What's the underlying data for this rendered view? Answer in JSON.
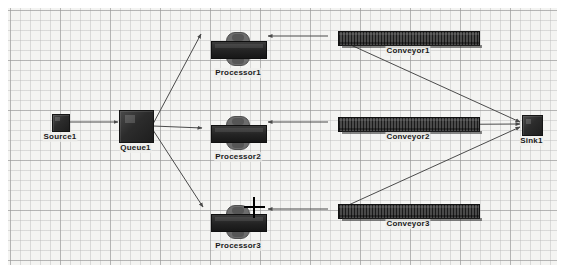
{
  "canvas": {
    "background_color": "#f4f4f2",
    "grid_minor_color": "#b9b9b9",
    "grid_major_color": "#969696",
    "grid_minor_spacing": 10,
    "grid_major_spacing": 50
  },
  "objects": [
    {
      "id": "source1",
      "label": "Source1",
      "type": "source",
      "x": 44,
      "y": 106,
      "w": 16,
      "h": 16,
      "color": "#262626"
    },
    {
      "id": "queue1",
      "label": "Queue1",
      "type": "queue",
      "x": 111,
      "y": 102,
      "w": 33,
      "h": 31,
      "color": "#262626"
    },
    {
      "id": "processor1",
      "label": "Processor1",
      "type": "processor",
      "x": 203,
      "y": 24,
      "w": 54,
      "h": 34,
      "color": "#232323"
    },
    {
      "id": "processor2",
      "label": "Processor2",
      "type": "processor",
      "x": 203,
      "y": 108,
      "w": 54,
      "h": 34,
      "color": "#232323"
    },
    {
      "id": "processor3",
      "label": "Processor3",
      "type": "processor",
      "x": 203,
      "y": 197,
      "w": 54,
      "h": 34,
      "color": "#232323"
    },
    {
      "id": "conveyor1",
      "label": "Conveyor1",
      "type": "conveyor",
      "x": 330,
      "y": 23,
      "w": 140,
      "h": 13,
      "color": "#2e2e2e"
    },
    {
      "id": "conveyor2",
      "label": "Conveyor2",
      "type": "conveyor",
      "x": 330,
      "y": 109,
      "w": 140,
      "h": 13,
      "color": "#2e2e2e"
    },
    {
      "id": "conveyor3",
      "label": "Conveyor3",
      "type": "conveyor",
      "x": 330,
      "y": 196,
      "w": 140,
      "h": 13,
      "color": "#2e2e2e"
    },
    {
      "id": "sink1",
      "label": "Sink1",
      "type": "sink",
      "x": 514,
      "y": 107,
      "w": 19,
      "h": 19,
      "color": "#262626"
    }
  ],
  "connections": [
    {
      "id": "source1-queue1",
      "from": "Source1",
      "to": "Queue1",
      "x1": 61,
      "y1": 114,
      "x2": 110,
      "y2": 114
    },
    {
      "id": "queue1-processor1",
      "from": "Queue1",
      "to": "Processor1",
      "x1": 145,
      "y1": 116,
      "x2": 193,
      "y2": 26
    },
    {
      "id": "queue1-processor2",
      "from": "Queue1",
      "to": "Processor2",
      "x1": 145,
      "y1": 118,
      "x2": 194,
      "y2": 120
    },
    {
      "id": "queue1-processor3",
      "from": "Queue1",
      "to": "Processor3",
      "x1": 145,
      "y1": 122,
      "x2": 195,
      "y2": 199
    },
    {
      "id": "processor1-conveyor1",
      "from": "Processor1",
      "to": "Conveyor1",
      "x1": 320,
      "y1": 28,
      "x2": 260,
      "y2": 28
    },
    {
      "id": "processor2-conveyor2",
      "from": "Processor2",
      "to": "Conveyor2",
      "x1": 320,
      "y1": 114,
      "x2": 260,
      "y2": 114
    },
    {
      "id": "processor3-conveyor3",
      "from": "Processor3",
      "to": "Conveyor3",
      "x1": 320,
      "y1": 201,
      "x2": 260,
      "y2": 201
    },
    {
      "id": "conveyor1-sink1",
      "from": "Conveyor1",
      "to": "Sink1",
      "x1": 334,
      "y1": 33,
      "x2": 512,
      "y2": 114
    },
    {
      "id": "conveyor2-sink1",
      "from": "Conveyor2",
      "to": "Sink1",
      "x1": 334,
      "y1": 117,
      "x2": 512,
      "y2": 116
    },
    {
      "id": "conveyor3-sink1",
      "from": "Conveyor3",
      "to": "Sink1",
      "x1": 334,
      "y1": 200,
      "x2": 512,
      "y2": 119
    }
  ],
  "cursor": {
    "type": "crosshair",
    "x": 236,
    "y": 189
  }
}
